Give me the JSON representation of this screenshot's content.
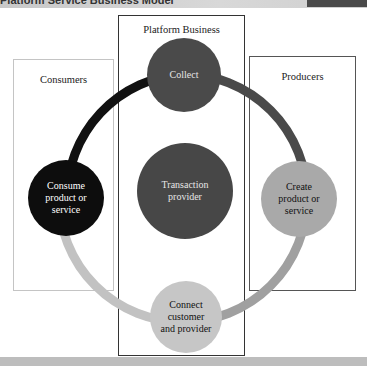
{
  "header": {
    "title": "Platform Service Business Model"
  },
  "boxes": {
    "consumers": {
      "label": "Consumers"
    },
    "platform": {
      "label": "Platform Business"
    },
    "producers": {
      "label": "Producers"
    }
  },
  "nodes": {
    "collect": {
      "label": "Collect",
      "color": "#4a4a4a",
      "text_color": "#e6e6e6"
    },
    "consume": {
      "label": "Consume product or service",
      "color": "#0d0d0d",
      "text_color": "#ffffff"
    },
    "transaction": {
      "label": "Transaction provider",
      "color": "#474747",
      "text_color": "#e6e6e6"
    },
    "create": {
      "label": "Create product or service",
      "color": "#a9a9a9",
      "text_color": "#111111"
    },
    "connect": {
      "label": "Connect customer and provider",
      "color": "#c6c6c6",
      "text_color": "#111111"
    }
  },
  "ring_segments": {
    "top_left": "#111111",
    "top_right": "#4a4a4a",
    "bottom_right": "#a0a0a0",
    "bottom_left": "#c2c2c2"
  }
}
